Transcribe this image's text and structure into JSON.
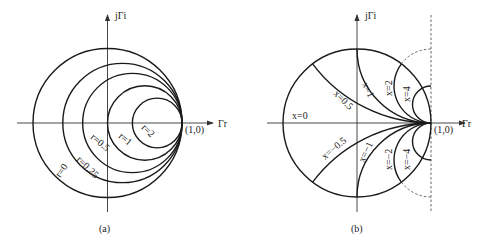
{
  "panel_a": {
    "caption": "(a)",
    "y_axis_label": "jΓi",
    "x_axis_label": "Γr",
    "point_label": "(1,0)",
    "resistance_labels": [
      "r=0",
      "r=0.25",
      "r=0.5",
      "r=1",
      "r=2"
    ],
    "resistance_values": [
      0,
      0.25,
      0.5,
      1,
      2
    ]
  },
  "panel_b": {
    "caption": "(b)",
    "y_axis_label": "jΓi",
    "x_axis_label": "Γr",
    "point_label": "(1,0)",
    "reactance_labels": {
      "x0": "x=0",
      "x05": "x=0.5",
      "x1": "x=1",
      "x2": "x=2",
      "x4": "x=4",
      "xm05": "x=−0.5",
      "xm1": "x=−1",
      "xm2": "x=−2",
      "xm4": "x=−4"
    },
    "reactance_values": [
      0,
      0.5,
      1,
      2,
      4,
      -0.5,
      -1,
      -2,
      -4
    ]
  }
}
